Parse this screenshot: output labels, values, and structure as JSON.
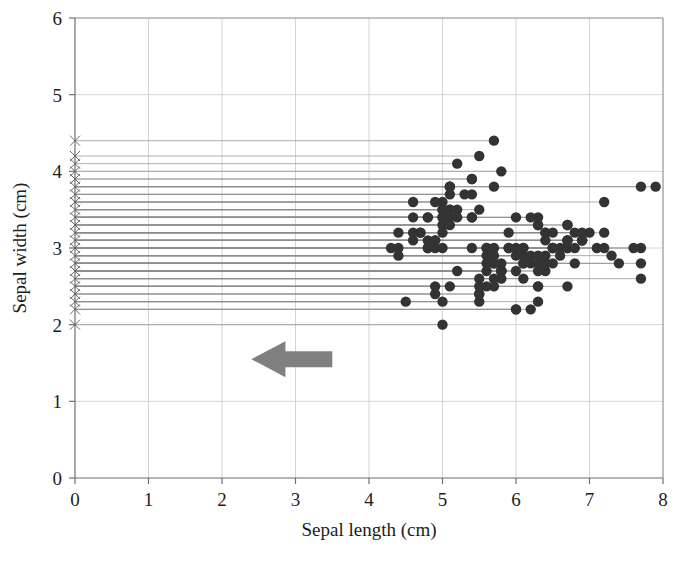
{
  "chart_data": {
    "type": "scatter",
    "title": "",
    "xlabel": "Sepal length (cm)",
    "ylabel": "Sepal width (cm)",
    "xlim": [
      0,
      8
    ],
    "ylim": [
      0,
      6
    ],
    "xticks": [
      "0",
      "1",
      "2",
      "3",
      "4",
      "5",
      "6",
      "7",
      "8"
    ],
    "yticks": [
      "0",
      "1",
      "2",
      "3",
      "4",
      "5",
      "6"
    ],
    "xtick_values": [
      0,
      1,
      2,
      3,
      4,
      5,
      6,
      7,
      8
    ],
    "ytick_values": [
      0,
      1,
      2,
      3,
      4,
      5,
      6
    ],
    "grid": true,
    "grid_color": "#c9c9c9",
    "legend": null,
    "point_color": "#333333",
    "point_marker": "circle",
    "point_radius": 5.2,
    "projection_marker": "x",
    "projection_marker_color": "#5a5a5a",
    "projection_x": 0,
    "connector_color": "#8d8d8d",
    "series": [
      {
        "name": "iris sepal measurements",
        "x": [
          5.1,
          4.9,
          4.7,
          4.6,
          5.0,
          5.4,
          4.6,
          5.0,
          4.4,
          4.9,
          5.4,
          4.8,
          4.8,
          4.3,
          5.8,
          5.7,
          5.4,
          5.1,
          5.7,
          5.1,
          5.4,
          5.1,
          4.6,
          5.1,
          4.8,
          5.0,
          5.0,
          5.2,
          5.2,
          4.7,
          4.8,
          5.4,
          5.2,
          5.5,
          4.9,
          5.0,
          5.5,
          4.9,
          4.4,
          5.1,
          5.0,
          4.5,
          4.4,
          5.0,
          5.1,
          4.8,
          5.1,
          4.6,
          5.3,
          5.0,
          7.0,
          6.4,
          6.9,
          5.5,
          6.5,
          5.7,
          6.3,
          4.9,
          6.6,
          5.2,
          5.0,
          5.9,
          6.0,
          6.1,
          5.6,
          6.7,
          5.6,
          5.8,
          6.2,
          5.6,
          5.9,
          6.1,
          6.3,
          6.1,
          6.4,
          6.6,
          6.8,
          6.7,
          6.0,
          5.7,
          5.5,
          5.5,
          5.8,
          6.0,
          5.4,
          6.0,
          6.7,
          6.3,
          5.6,
          5.5,
          5.5,
          6.1,
          5.8,
          5.0,
          5.6,
          5.7,
          5.7,
          6.2,
          5.1,
          5.7,
          6.3,
          5.8,
          7.1,
          6.3,
          6.5,
          7.6,
          4.9,
          7.3,
          6.7,
          7.2,
          6.5,
          6.4,
          6.8,
          5.7,
          5.8,
          6.4,
          6.5,
          7.7,
          7.7,
          6.0,
          6.9,
          5.6,
          7.7,
          6.3,
          6.7,
          7.2,
          6.2,
          6.1,
          6.4,
          7.2,
          7.4,
          7.9,
          6.4,
          6.3,
          6.1,
          7.7,
          6.3,
          6.4,
          6.0,
          6.9,
          6.7,
          6.9,
          5.8,
          6.8,
          6.7,
          6.7,
          6.3,
          6.5,
          6.2,
          5.9
        ],
        "y": [
          3.5,
          3.0,
          3.2,
          3.1,
          3.6,
          3.9,
          3.4,
          3.4,
          2.9,
          3.1,
          3.7,
          3.4,
          3.0,
          3.0,
          4.0,
          4.4,
          3.9,
          3.5,
          3.8,
          3.8,
          3.4,
          3.7,
          3.6,
          3.3,
          3.4,
          3.0,
          3.4,
          3.5,
          3.4,
          3.2,
          3.1,
          3.4,
          4.1,
          4.2,
          3.1,
          3.2,
          3.5,
          3.6,
          3.0,
          3.4,
          3.5,
          2.3,
          3.2,
          3.5,
          3.8,
          3.0,
          3.8,
          3.2,
          3.7,
          3.3,
          3.2,
          3.2,
          3.1,
          2.3,
          2.8,
          2.8,
          3.3,
          2.4,
          2.9,
          2.7,
          2.0,
          3.0,
          2.2,
          2.9,
          2.9,
          3.1,
          3.0,
          2.7,
          2.2,
          2.5,
          3.2,
          2.8,
          2.5,
          2.8,
          2.9,
          3.0,
          2.8,
          3.0,
          2.9,
          2.6,
          2.4,
          2.4,
          2.7,
          2.7,
          3.0,
          3.4,
          3.1,
          2.3,
          3.0,
          2.5,
          2.6,
          3.0,
          2.6,
          2.3,
          2.7,
          3.0,
          2.9,
          2.9,
          2.5,
          2.8,
          3.3,
          2.7,
          3.0,
          2.9,
          3.0,
          3.0,
          2.5,
          2.9,
          2.5,
          3.6,
          3.2,
          2.7,
          3.0,
          2.5,
          2.8,
          3.2,
          3.0,
          3.8,
          2.6,
          2.2,
          3.2,
          2.8,
          2.8,
          2.7,
          3.3,
          3.2,
          2.8,
          3.0,
          2.8,
          3.0,
          2.8,
          3.8,
          2.8,
          2.8,
          2.6,
          3.0,
          3.4,
          3.1,
          3.0,
          3.1,
          3.1,
          3.1,
          2.7,
          3.2,
          3.3,
          3.0,
          2.5,
          3.0,
          3.4,
          3.0
        ]
      }
    ],
    "annotations": [
      {
        "name": "left-pointing-arrow",
        "type": "arrow",
        "direction": "left",
        "color": "#808080",
        "x_start": 3.5,
        "x_end": 2.4,
        "y": 1.55
      }
    ]
  }
}
